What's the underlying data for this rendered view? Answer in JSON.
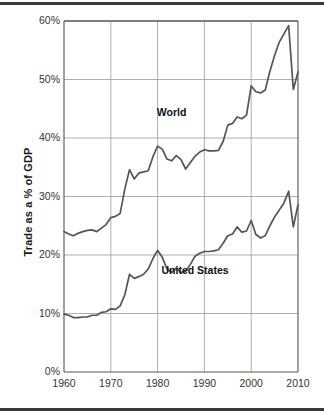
{
  "figure": {
    "name": "trade-as-percent-of-gdp-chart",
    "background_color": "#ffffff",
    "rule_color": "#3a3a3a",
    "line_color": "#555555",
    "grid_color": "#9a9a9a",
    "axis_color": "#555555"
  },
  "chart_data": {
    "type": "line",
    "title": "",
    "subtitle": "",
    "xlabel": "",
    "ylabel": "Trade as a % of GDP",
    "xlim": [
      1960,
      2010
    ],
    "ylim": [
      0,
      60
    ],
    "grid": true,
    "legend_position": "inline-annotations",
    "y_ticks": [
      0,
      10,
      20,
      30,
      40,
      50,
      60
    ],
    "y_tick_labels": [
      "0%",
      "10%",
      "20%",
      "30%",
      "40%",
      "50%",
      "60%"
    ],
    "x_ticks": [
      1960,
      1970,
      1980,
      1990,
      2000,
      2010
    ],
    "x_tick_labels": [
      "1960",
      "1970",
      "1980",
      "1990",
      "2000",
      "2010"
    ],
    "annotations": [
      {
        "text": "World",
        "x": 1983,
        "y": 44.5
      },
      {
        "text": "United States",
        "x": 1988,
        "y": 17.5
      }
    ],
    "x": [
      1960,
      1961,
      1962,
      1963,
      1964,
      1965,
      1966,
      1967,
      1968,
      1969,
      1970,
      1971,
      1972,
      1973,
      1974,
      1975,
      1976,
      1977,
      1978,
      1979,
      1980,
      1981,
      1982,
      1983,
      1984,
      1985,
      1986,
      1987,
      1988,
      1989,
      1990,
      1991,
      1992,
      1993,
      1994,
      1995,
      1996,
      1997,
      1998,
      1999,
      2000,
      2001,
      2002,
      2003,
      2004,
      2005,
      2006,
      2007,
      2008,
      2009,
      2010
    ],
    "series": [
      {
        "name": "World",
        "values": [
          24.0,
          23.6,
          23.3,
          23.7,
          24.0,
          24.2,
          24.3,
          24.0,
          24.6,
          25.2,
          26.4,
          26.6,
          27.1,
          31.3,
          34.6,
          33.0,
          34.0,
          34.2,
          34.4,
          36.8,
          38.6,
          38.1,
          36.4,
          36.1,
          37.0,
          36.3,
          34.7,
          35.8,
          36.9,
          37.6,
          38.0,
          37.8,
          37.8,
          37.9,
          39.4,
          42.2,
          42.5,
          43.6,
          43.3,
          43.9,
          48.9,
          47.9,
          47.7,
          48.2,
          51.4,
          54.1,
          56.4,
          57.8,
          59.2,
          48.3,
          51.3
        ]
      },
      {
        "name": "United States",
        "values": [
          9.9,
          9.7,
          9.3,
          9.3,
          9.4,
          9.4,
          9.7,
          9.7,
          10.2,
          10.3,
          10.8,
          10.7,
          11.3,
          13.2,
          16.7,
          16.0,
          16.3,
          16.7,
          17.6,
          19.4,
          20.8,
          19.6,
          17.6,
          17.0,
          17.8,
          17.0,
          17.2,
          18.4,
          19.8,
          20.3,
          20.6,
          20.6,
          20.7,
          20.9,
          22.0,
          23.3,
          23.6,
          24.8,
          23.9,
          24.1,
          25.9,
          23.5,
          22.9,
          23.3,
          25.0,
          26.5,
          27.7,
          28.9,
          30.9,
          24.8,
          28.6
        ]
      }
    ]
  },
  "axes": {
    "y_axis_title": "Trade as a % of GDP"
  }
}
